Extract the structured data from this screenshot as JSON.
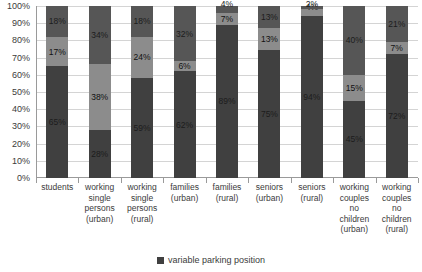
{
  "chart_data": {
    "type": "bar",
    "stacked": true,
    "stack_mode": "percent",
    "title": "",
    "subtitle": "",
    "xlabel": "",
    "ylabel": "",
    "ylim": [
      0,
      100
    ],
    "grid": true,
    "legend_position": "bottom",
    "y_ticks": [
      "100%",
      "90%",
      "80%",
      "70%",
      "60%",
      "50%",
      "40%",
      "30%",
      "20%",
      "10%",
      "0%"
    ],
    "y_tick_values": [
      100,
      90,
      80,
      70,
      60,
      50,
      40,
      30,
      20,
      10,
      0
    ],
    "categories": [
      "students",
      "working single persons (urban)",
      "working single persons (rural)",
      "families (urban)",
      "families (rural)",
      "seniors (urban)",
      "seniors (rural)",
      "working couples no children (urban)",
      "working couples no children (rural)"
    ],
    "category_lines": [
      [
        "students"
      ],
      [
        "working",
        "single",
        "persons",
        "(urban)"
      ],
      [
        "working",
        "single",
        "persons",
        "(rural)"
      ],
      [
        "families",
        "(urban)"
      ],
      [
        "families",
        "(rural)"
      ],
      [
        "seniors",
        "(urban)"
      ],
      [
        "seniors",
        "(rural)"
      ],
      [
        "working",
        "couples",
        "no",
        "children",
        "(urban)"
      ],
      [
        "working",
        "couples",
        "no",
        "children",
        "(rural)"
      ]
    ],
    "series": [
      {
        "name": "variable parking position",
        "color": "#404040",
        "values": [
          65,
          28,
          59,
          62,
          89,
          75,
          94,
          45,
          72
        ],
        "labels": [
          "65%",
          "28%",
          "59%",
          "62%",
          "89%",
          "75%",
          "94%",
          "45%",
          "72%"
        ]
      },
      {
        "name": "series-2",
        "color": "#8c8c8c",
        "values": [
          17,
          38,
          24,
          6,
          7,
          13,
          4,
          15,
          7
        ],
        "labels": [
          "17%",
          "38%",
          "24%",
          "6%",
          "7%",
          "13%",
          "4%",
          "15%",
          "7%"
        ]
      },
      {
        "name": "series-3",
        "color": "#565656",
        "values": [
          18,
          34,
          18,
          32,
          4,
          13,
          2,
          40,
          21
        ],
        "labels": [
          "18%",
          "34%",
          "18%",
          "32%",
          "4%",
          "13%",
          "2%",
          "40%",
          "21%"
        ]
      }
    ]
  },
  "legend": {
    "items": [
      {
        "label": "variable parking position",
        "color": "#404040"
      }
    ]
  },
  "colors": {
    "segment_bottom": "#404040",
    "segment_middle": "#8c8c8c",
    "segment_top": "#565656",
    "gridline": "#d4d4d4",
    "axis": "#9a9a9a",
    "text": "#3b3b3b",
    "background": "#ffffff"
  }
}
